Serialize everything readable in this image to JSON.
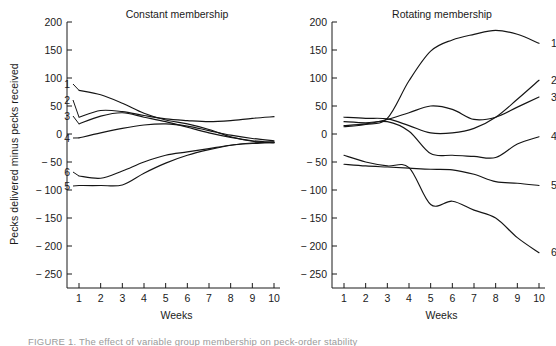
{
  "figure": {
    "ylabel": "Pecks delivered minus pecks received",
    "xlabel_left": "Weeks",
    "xlabel_right": "Weeks",
    "title_left": "Constant membership",
    "title_right": "Rotating membership"
  },
  "axis": {
    "y_ticks": [
      "200",
      "150",
      "100",
      "50",
      "0",
      "− 50",
      "− 100",
      "− 150",
      "− 200",
      "− 250"
    ],
    "x_ticks": [
      "1",
      "2",
      "3",
      "4",
      "5",
      "6",
      "7",
      "8",
      "9",
      "10"
    ]
  },
  "curve_labels": [
    "1",
    "2",
    "3",
    "4",
    "5",
    "6"
  ],
  "caption": {
    "text": "FIGURE 1.  The effect of variable group membership on peck-order stability"
  },
  "chart_data": {
    "type": "line",
    "xlabel": "Weeks",
    "ylabel": "Pecks delivered minus pecks received",
    "x": [
      1,
      2,
      3,
      4,
      5,
      6,
      7,
      8,
      9,
      10
    ],
    "ylim": [
      -275,
      200
    ],
    "xlim": [
      0.5,
      10.5
    ],
    "grid": false,
    "legend": "inline-end-labels",
    "panels": [
      {
        "name": "Constant membership",
        "label_side": "left",
        "series": [
          {
            "name": "1",
            "values": [
              78,
              70,
              55,
              37,
              25,
              18,
              8,
              -5,
              -13,
              -16
            ]
          },
          {
            "name": "2",
            "values": [
              30,
              42,
              40,
              33,
              27,
              24,
              22,
              24,
              28,
              31
            ]
          },
          {
            "name": "3",
            "values": [
              18,
              32,
              38,
              30,
              22,
              12,
              2,
              -6,
              -12,
              -15
            ]
          },
          {
            "name": "4",
            "values": [
              -7,
              2,
              10,
              16,
              18,
              14,
              6,
              -2,
              -8,
              -12
            ]
          },
          {
            "name": "5",
            "values": [
              -92,
              -92,
              -91,
              -70,
              -52,
              -38,
              -28,
              -20,
              -16,
              -14
            ]
          },
          {
            "name": "6",
            "values": [
              -75,
              -79,
              -66,
              -50,
              -38,
              -32,
              -26,
              -20,
              -17,
              -15
            ]
          }
        ]
      },
      {
        "name": "Rotating membership",
        "label_side": "right",
        "series": [
          {
            "name": "1",
            "values": [
              13,
              17,
              28,
              95,
              148,
              168,
              178,
              185,
              178,
              162
            ]
          },
          {
            "name": "2",
            "values": [
              30,
              28,
              27,
              15,
              2,
              2,
              10,
              30,
              62,
              96
            ]
          },
          {
            "name": "3",
            "values": [
              15,
              18,
              26,
              38,
              50,
              44,
              26,
              30,
              48,
              66
            ]
          },
          {
            "name": "4",
            "values": [
              22,
              20,
              22,
              5,
              -35,
              -38,
              -40,
              -42,
              -18,
              -5
            ]
          },
          {
            "name": "5",
            "values": [
              -54,
              -57,
              -59,
              -61,
              -63,
              -64,
              -72,
              -85,
              -88,
              -92
            ]
          },
          {
            "name": "6",
            "values": [
              -38,
              -50,
              -57,
              -60,
              -126,
              -120,
              -136,
              -150,
              -185,
              -212
            ]
          }
        ]
      }
    ]
  }
}
